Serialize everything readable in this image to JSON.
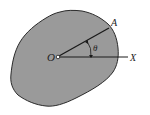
{
  "diagram": {
    "type": "rigid-body-rotation",
    "colors": {
      "body_fill": "#9a9a9a",
      "outline": "#2a2a2a",
      "background": "#ffffff"
    },
    "labels": {
      "origin": "O",
      "point": "A",
      "axis": "X",
      "angle": "θ"
    },
    "elements": [
      {
        "id": "body",
        "kind": "irregular-shape"
      },
      {
        "id": "line-OA",
        "from": "O",
        "to": "A"
      },
      {
        "id": "line-OX",
        "from": "O",
        "to": "X"
      },
      {
        "id": "angle-arc",
        "between": [
          "OA",
          "OX"
        ],
        "label": "θ"
      },
      {
        "id": "pivot",
        "at": "O",
        "kind": "small-circle"
      }
    ]
  }
}
